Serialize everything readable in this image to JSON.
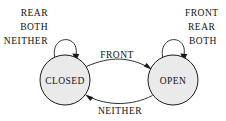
{
  "diagram": {
    "type": "finite-state-machine",
    "title": "",
    "states": [
      {
        "id": "closed",
        "label": "CLOSED",
        "cx": 65,
        "cy": 80,
        "r": 25,
        "fill": "#eaeaea",
        "stroke": "#1a1a1a"
      },
      {
        "id": "open",
        "label": "OPEN",
        "cx": 173,
        "cy": 80,
        "r": 25,
        "fill": "#eaeaea",
        "stroke": "#1a1a1a"
      }
    ],
    "transitions": [
      {
        "id": "closed-to-open",
        "from": "closed",
        "to": "open",
        "label": "FRONT",
        "direction": "left-to-right",
        "label_position": "above"
      },
      {
        "id": "open-to-closed",
        "from": "open",
        "to": "closed",
        "label": "NEITHER",
        "direction": "right-to-left",
        "label_position": "below"
      }
    ],
    "self_loops": [
      {
        "id": "closed-self-loop",
        "state": "closed",
        "labels": [
          "REAR",
          "BOTH",
          "NEITHER"
        ],
        "label_align": "right",
        "label_side": "left"
      },
      {
        "id": "open-self-loop",
        "state": "open",
        "labels": [
          "FRONT",
          "REAR",
          "BOTH"
        ],
        "label_align": "left",
        "label_side": "right"
      }
    ],
    "colors": {
      "background": "#ffffff",
      "state_fill": "#eaeaea",
      "stroke": "#1a1a1a",
      "text": "#111111"
    }
  }
}
